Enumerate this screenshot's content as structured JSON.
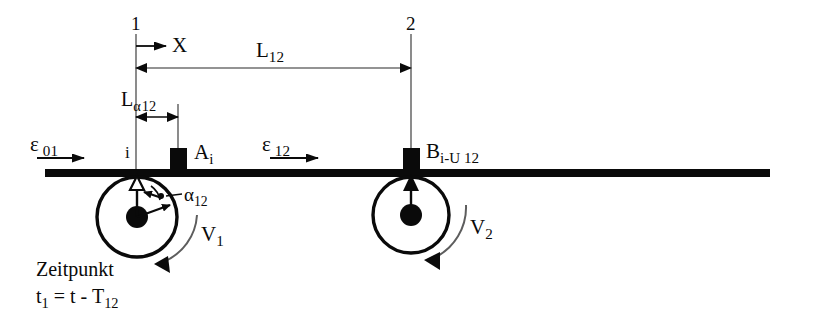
{
  "diagram": {
    "colors": {
      "ink": "#0a0a0a",
      "thin_line": "#6f6f6f",
      "background": "#ffffff"
    },
    "nodes": [
      {
        "id": "node-1",
        "label": "1",
        "x": 136
      },
      {
        "id": "node-2",
        "label": "2",
        "x": 411
      }
    ],
    "axis": {
      "label": "X",
      "arrow_from_x": 136,
      "arrow_to_x": 170,
      "y": 46
    },
    "dimensions": [
      {
        "id": "length-12",
        "label": "L",
        "subscript": "12",
        "from_x": 136,
        "to_x": 411,
        "y": 68
      },
      {
        "id": "length-alpha-12",
        "label": "L",
        "subscript_alpha": "α",
        "subscript": "12",
        "from_x": 136,
        "to_x": 178,
        "y": 117
      }
    ],
    "flow_labels": [
      {
        "id": "epsilon-01",
        "symbol": "ε",
        "subscript": "01",
        "x": 33,
        "y": 139
      },
      {
        "id": "epsilon-12",
        "symbol": "ε",
        "subscript": "12",
        "x": 263,
        "y": 139
      }
    ],
    "blocks": [
      {
        "id": "block-a",
        "label": "A",
        "subscript": "i",
        "x": 178,
        "label_x": 196,
        "label_y": 147
      },
      {
        "id": "block-b",
        "label": "B",
        "subscript": "i-U 12",
        "x": 411,
        "label_x": 428,
        "label_y": 145
      }
    ],
    "point_label": {
      "id": "point-i",
      "label": "i",
      "x": 128,
      "y": 146
    },
    "angle_label": {
      "id": "angle-alpha-12",
      "symbol": "α",
      "subscript": "12",
      "x": 184,
      "y": 191
    },
    "wheels": [
      {
        "id": "wheel-1",
        "center_x": 137,
        "center_y": 217,
        "radius": 40,
        "hub_radius": 11,
        "velocity_label": "V",
        "velocity_subscript": "1",
        "velocity_label_x": 203,
        "velocity_label_y": 232
      },
      {
        "id": "wheel-2",
        "center_x": 411,
        "center_y": 215,
        "radius": 38,
        "hub_radius": 11,
        "velocity_label": "V",
        "velocity_subscript": "2",
        "velocity_label_x": 472,
        "velocity_label_y": 225
      }
    ],
    "rail": {
      "from_x": 45,
      "to_x": 770,
      "y": 173,
      "thickness": 8
    },
    "time_note": {
      "line1": "Zeitpunkt",
      "line2_prefix": "t",
      "line2_sub1": "1",
      "line2_mid": " = t - T",
      "line2_sub2": "12",
      "x": 36,
      "y": 258
    }
  }
}
